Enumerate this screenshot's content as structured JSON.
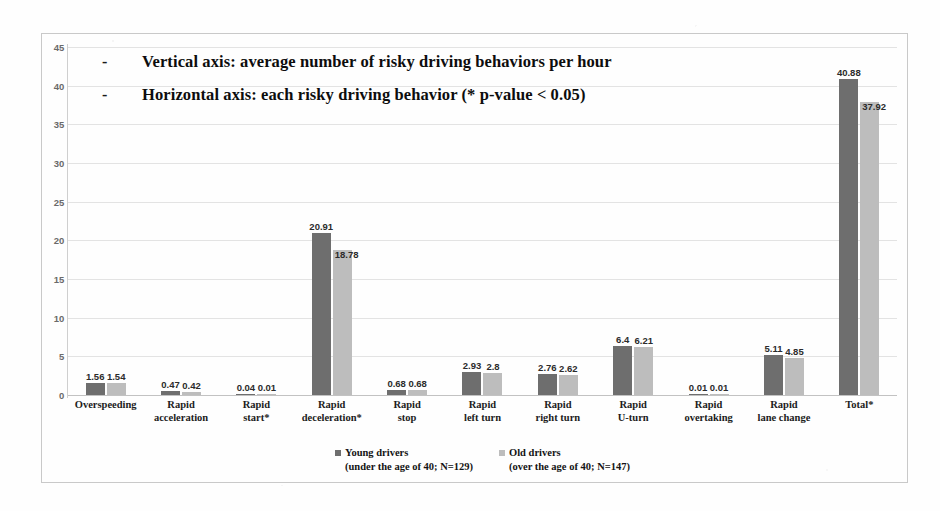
{
  "annotations": [
    {
      "bullet": "-",
      "text": "Vertical axis: average number of risky driving behaviors per hour"
    },
    {
      "bullet": "-",
      "text": "Horizontal axis: each risky driving behavior (* p-value < 0.05)"
    }
  ],
  "legend": [
    {
      "name": "Young drivers",
      "detail": "(under the age of 40; N=129)",
      "color": "#6e6e6e"
    },
    {
      "name": "Old drivers",
      "detail": "(over the age of 40; N=147)",
      "color": "#bdbdbd"
    }
  ],
  "chart_data": {
    "type": "bar",
    "title": "",
    "xlabel": "each risky driving behavior (* p-value < 0.05)",
    "ylabel": "average number of risky driving behaviors per hour",
    "ylim": [
      0,
      45
    ],
    "yticks": [
      0,
      5,
      10,
      15,
      20,
      25,
      30,
      35,
      40,
      45
    ],
    "grid": true,
    "legend_position": "bottom",
    "categories": [
      "Overspeeding",
      "Rapid acceleration",
      "Rapid start*",
      "Rapid deceleration*",
      "Rapid stop",
      "Rapid left turn",
      "Rapid right turn",
      "Rapid U-turn",
      "Rapid overtaking",
      "Rapid lane change",
      "Total*"
    ],
    "category_lines": [
      [
        "Overspeeding",
        ""
      ],
      [
        "Rapid",
        "acceleration"
      ],
      [
        "Rapid",
        "start*"
      ],
      [
        "Rapid",
        "deceleration*"
      ],
      [
        "Rapid",
        "stop"
      ],
      [
        "Rapid",
        "left turn"
      ],
      [
        "Rapid",
        "right turn"
      ],
      [
        "Rapid",
        "U-turn"
      ],
      [
        "Rapid",
        "overtaking"
      ],
      [
        "Rapid",
        "lane change"
      ],
      [
        "Total*",
        ""
      ]
    ],
    "series": [
      {
        "name": "Young drivers",
        "color": "#6e6e6e",
        "values": [
          1.56,
          0.47,
          0.04,
          20.91,
          0.68,
          2.93,
          2.76,
          6.4,
          0.01,
          5.11,
          40.88
        ],
        "labels": [
          "1.56",
          "0.47",
          "0.04",
          "20.91",
          "0.68",
          "2.93",
          "2.76",
          "6.4",
          "0.01",
          "5.11",
          "40.88"
        ]
      },
      {
        "name": "Old drivers",
        "color": "#bdbdbd",
        "values": [
          1.54,
          0.42,
          0.01,
          18.78,
          0.68,
          2.8,
          2.62,
          6.21,
          0.01,
          4.85,
          37.92
        ],
        "labels": [
          "1.54",
          "0.42",
          "0.01",
          "18.78",
          "0.68",
          "2.8",
          "2.62",
          "6.21",
          "0.01",
          "4.85",
          "37.92"
        ]
      }
    ]
  }
}
